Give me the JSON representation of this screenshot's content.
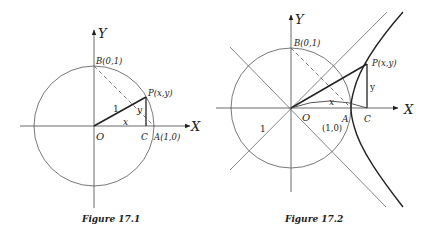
{
  "figures": [
    {
      "id": "fig1",
      "caption": "Figure 17.1",
      "axes": {
        "x_label": "X",
        "y_label": "Y"
      },
      "points": {
        "origin": "O",
        "B": "B(0,1)",
        "P": "P(x,y)",
        "C": "C",
        "A": "A(1,0)"
      },
      "segment_labels": {
        "radius": "1",
        "x": "x",
        "y": "y"
      },
      "curves": [
        "unit circle"
      ]
    },
    {
      "id": "fig2",
      "caption": "Figure 17.2",
      "axes": {
        "x_label": "X",
        "y_label": "Y"
      },
      "points": {
        "origin": "O",
        "B": "B(0,1)",
        "P": "P(x,y)",
        "C": "C",
        "A": "A",
        "A_coords": "(1,0)"
      },
      "segment_labels": {
        "radius": "1",
        "x": "x",
        "y": "y"
      },
      "curves": [
        "unit circle",
        "unit hyperbola x²−y²=1",
        "asymptotes y=±x"
      ]
    }
  ],
  "colors": {
    "ink": "#222222",
    "thin": "#555555",
    "background": "#ffffff"
  }
}
